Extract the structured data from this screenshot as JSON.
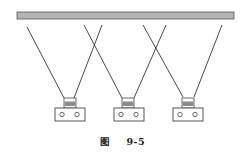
{
  "figure": {
    "caption_prefix": "图",
    "caption_number": "9-5",
    "colors": {
      "ceiling_fill": "#b4b4b4",
      "ceiling_stroke": "#555555",
      "line": "#333333",
      "cap_band": "#8c8c8c",
      "fixture_stroke": "#444444"
    },
    "ceiling": {
      "x1": 17,
      "x2": 234,
      "y1": 12,
      "y2": 19
    },
    "beams": [
      {
        "x1": 27,
        "y1": 27,
        "x2": 64,
        "y2": 98
      },
      {
        "x1": 102,
        "y1": 25,
        "x2": 74,
        "y2": 98
      },
      {
        "x1": 84,
        "y1": 25,
        "x2": 122,
        "y2": 98
      },
      {
        "x1": 166,
        "y1": 25,
        "x2": 134,
        "y2": 98
      },
      {
        "x1": 143,
        "y1": 25,
        "x2": 183,
        "y2": 97
      },
      {
        "x1": 222,
        "y1": 25,
        "x2": 194,
        "y2": 97
      }
    ],
    "fixtures": [
      {
        "label": "fixture-1",
        "cap_x": 64,
        "base_x": 55
      },
      {
        "label": "fixture-2",
        "cap_x": 122,
        "base_x": 114
      },
      {
        "label": "fixture-3",
        "cap_x": 182,
        "base_x": 173
      }
    ]
  }
}
